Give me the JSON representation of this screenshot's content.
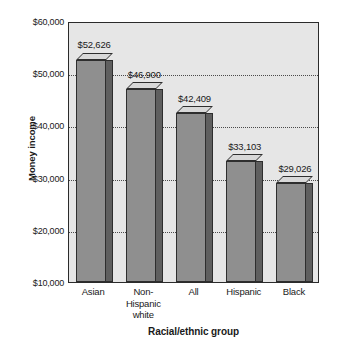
{
  "chart_data": {
    "type": "bar",
    "title": "",
    "xlabel": "Racial/ethnic group",
    "ylabel": "Money income",
    "categories": [
      "Asian",
      "Non-\nHispanic\nwhite",
      "All",
      "Hispanic",
      "Black"
    ],
    "category_lines": [
      [
        "Asian"
      ],
      [
        "Non-",
        "Hispanic",
        "white"
      ],
      [
        "All"
      ],
      [
        "Hispanic"
      ],
      [
        "Black"
      ]
    ],
    "values": [
      52626,
      46900,
      42409,
      33103,
      29026
    ],
    "value_labels": [
      "$52,626",
      "$46,900",
      "$42,409",
      "$33,103",
      "$29,026"
    ],
    "ylim": [
      10000,
      60000
    ],
    "ytick_values": [
      60000,
      50000,
      40000,
      30000,
      20000,
      10000
    ],
    "ytick_labels": [
      "$60,000",
      "$50,000",
      "$40,000",
      "$30,000",
      "$20,000",
      "$10,000"
    ],
    "grid": true,
    "gridline_values": [
      50000,
      40000,
      30000,
      20000
    ],
    "legend": null,
    "legend_position": "none",
    "style": {
      "plot_background": "#e6e6e6",
      "bar_front": "#8f8f8f",
      "bar_side": "#5f5f5f",
      "bar_top": "#d8d8d8",
      "bar_outline": "#2e2e2e",
      "axis_color": "#2b2b2b",
      "gridline_color": "#4a4a4a",
      "text_color": "#1a1a1a",
      "page_background": "#ffffff"
    }
  }
}
